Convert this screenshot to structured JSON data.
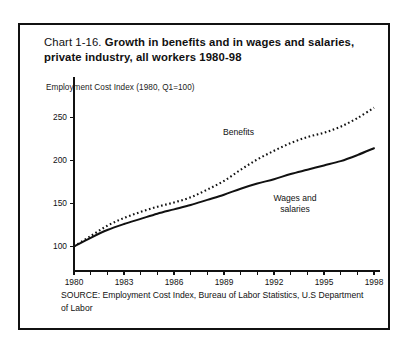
{
  "figure": {
    "title_prefix": "Chart 1-16. ",
    "title_main": "Growth in benefits and in wages and salaries, private industry, all workers 1980-98",
    "axis_caption": "Employment Cost Index (1980, Q1=100)",
    "source": "SOURCE: Employment Cost Index, Bureau of Labor Statistics, U.S Department of Labor",
    "border_color": "#111111",
    "background_color": "#ffffff",
    "ink_color": "#111111"
  },
  "annotations": {
    "benefits_label": "Benefits",
    "wages_label_line1": "Wages and",
    "wages_label_line2": "salaries"
  },
  "chart_data": {
    "type": "line",
    "title": "Chart 1-16. Growth in benefits and in wages and salaries, private industry, all workers 1980-98",
    "subtitle": "",
    "xlabel": "",
    "ylabel": "Employment Cost Index (1980, Q1=100)",
    "xlim": [
      1980,
      1998
    ],
    "ylim": [
      90,
      270
    ],
    "grid": false,
    "legend": "inline-annotations",
    "x_tick_labels": [
      "1980",
      "1983",
      "1986",
      "1989",
      "1992",
      "1995",
      "1998"
    ],
    "x_tick_values": [
      1980,
      1983,
      1986,
      1989,
      1992,
      1995,
      1998
    ],
    "x_minor_ticks": [
      1980,
      1981,
      1982,
      1983,
      1984,
      1985,
      1986,
      1987,
      1988,
      1989,
      1990,
      1991,
      1992,
      1993,
      1994,
      1995,
      1996,
      1997,
      1998
    ],
    "y_tick_labels": [
      "100",
      "150",
      "200",
      "250"
    ],
    "y_tick_values": [
      100,
      150,
      200,
      250
    ],
    "x": [
      1980,
      1981,
      1982,
      1983,
      1984,
      1985,
      1986,
      1987,
      1988,
      1989,
      1990,
      1991,
      1992,
      1993,
      1994,
      1995,
      1996,
      1997,
      1998
    ],
    "series": [
      {
        "name": "Benefits",
        "style": "dotted",
        "values": [
          100,
          112,
          124,
          133,
          140,
          146,
          151,
          157,
          166,
          176,
          189,
          201,
          211,
          220,
          227,
          232,
          239,
          249,
          261
        ]
      },
      {
        "name": "Wages and salaries",
        "style": "solid",
        "values": [
          100,
          110,
          119,
          126,
          132,
          138,
          143,
          148,
          154,
          160,
          167,
          173,
          178,
          184,
          189,
          194,
          199,
          206,
          214
        ]
      }
    ]
  }
}
